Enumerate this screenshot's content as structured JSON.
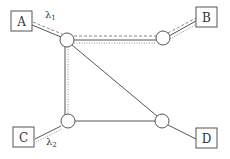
{
  "diagram": {
    "type": "network-topology",
    "colors": {
      "line": "#555555",
      "box": "#555555",
      "background": "#ffffff"
    },
    "endpoints": [
      {
        "id": "A",
        "label": "A"
      },
      {
        "id": "B",
        "label": "B"
      },
      {
        "id": "C",
        "label": "C"
      },
      {
        "id": "D",
        "label": "D"
      }
    ],
    "routers": [
      {
        "id": "R1",
        "position": "top-left"
      },
      {
        "id": "R2",
        "position": "top-right"
      },
      {
        "id": "R3",
        "position": "bottom-left"
      },
      {
        "id": "R4",
        "position": "bottom-right"
      }
    ],
    "links": [
      {
        "from": "A",
        "to": "R1"
      },
      {
        "from": "R1",
        "to": "R2"
      },
      {
        "from": "R2",
        "to": "B"
      },
      {
        "from": "R1",
        "to": "R3"
      },
      {
        "from": "R1",
        "to": "R4"
      },
      {
        "from": "R3",
        "to": "R4"
      },
      {
        "from": "C",
        "to": "R3"
      },
      {
        "from": "R4",
        "to": "D"
      }
    ],
    "flows": [
      {
        "label_main": "λ",
        "label_sub": "1",
        "path": [
          "A",
          "R1",
          "R2",
          "B"
        ],
        "style": "dashed"
      },
      {
        "label_main": "λ",
        "label_sub": "2",
        "path": [
          "C",
          "R3",
          "R1",
          "R2",
          "B"
        ],
        "style": "dotted"
      }
    ]
  }
}
